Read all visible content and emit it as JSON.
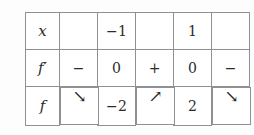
{
  "table": {
    "caption": "variation table",
    "rows": [
      {
        "name": "x-row",
        "label": "x",
        "cells": [
          {
            "name": "x-cell-1",
            "text": "",
            "kind": "empty"
          },
          {
            "name": "x-cell-2",
            "text": "−1",
            "kind": "value"
          },
          {
            "name": "x-cell-3",
            "text": "",
            "kind": "empty"
          },
          {
            "name": "x-cell-4",
            "text": "1",
            "kind": "value"
          },
          {
            "name": "x-cell-5",
            "text": "",
            "kind": "empty"
          }
        ]
      },
      {
        "name": "f-prime-row",
        "label": "f′",
        "cells": [
          {
            "name": "fprime-cell-1",
            "text": "−",
            "kind": "sign"
          },
          {
            "name": "fprime-cell-2",
            "text": "0",
            "kind": "value"
          },
          {
            "name": "fprime-cell-3",
            "text": "+",
            "kind": "sign"
          },
          {
            "name": "fprime-cell-4",
            "text": "0",
            "kind": "value"
          },
          {
            "name": "fprime-cell-5",
            "text": "−",
            "kind": "sign"
          }
        ]
      },
      {
        "name": "f-row",
        "label": "f",
        "cells": [
          {
            "name": "f-cell-1",
            "text": "↘",
            "kind": "arrow-down"
          },
          {
            "name": "f-cell-2",
            "text": "−2",
            "kind": "value"
          },
          {
            "name": "f-cell-3",
            "text": "↗",
            "kind": "arrow-up"
          },
          {
            "name": "f-cell-4",
            "text": "2",
            "kind": "value"
          },
          {
            "name": "f-cell-5",
            "text": "↘",
            "kind": "arrow-down"
          }
        ]
      }
    ]
  },
  "colors": {
    "border": "#8e9094",
    "text": "#2b2b2b",
    "sign_text": "#55565a",
    "arrow": "#4a4b4f",
    "background": "#fdfdfd",
    "cell_background": "#ffffff"
  }
}
